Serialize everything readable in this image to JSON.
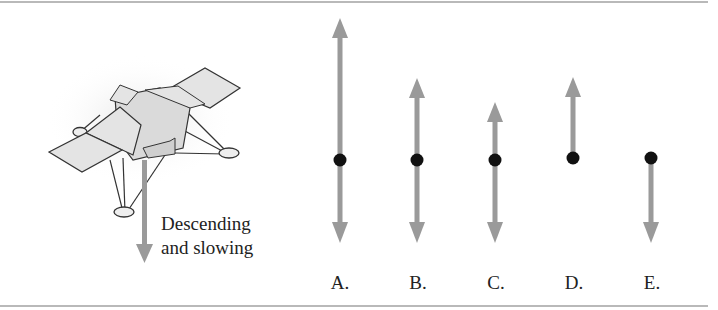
{
  "figure": {
    "lander": {
      "caption_line1": "Descending",
      "caption_line2": "and slowing",
      "velocity_arrow_direction": "down"
    },
    "options": [
      {
        "label": "A.",
        "up_length": "longest",
        "down_length": "short",
        "x": 340,
        "up_tip": 18,
        "down_tip": 243
      },
      {
        "label": "B.",
        "up_length": "medium",
        "down_length": "short",
        "x": 417,
        "up_tip": 78,
        "down_tip": 243
      },
      {
        "label": "C.",
        "up_length": "short",
        "down_length": "short",
        "x": 495,
        "up_tip": 102,
        "down_tip": 243
      },
      {
        "label": "D.",
        "up_length": "medium",
        "down_length": "none",
        "x": 573,
        "up_tip": 77,
        "down_tip": null
      },
      {
        "label": "E.",
        "up_length": "none",
        "down_length": "short",
        "x": 651,
        "up_tip": null,
        "down_tip": 243
      }
    ],
    "colors": {
      "arrow": "#9a9a9a",
      "dot": "#111111",
      "border": "#b9b9b9",
      "lander_fill": "#e2e2e2",
      "lander_stroke": "#333333"
    }
  }
}
